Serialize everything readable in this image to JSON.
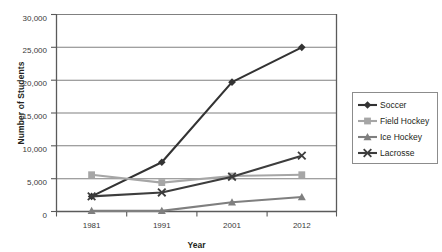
{
  "chart_data": {
    "type": "line",
    "title": "",
    "xlabel": "Year",
    "ylabel": "Number of Students",
    "categories": [
      "1981",
      "1991",
      "2001",
      "2012"
    ],
    "x_tick_labels": [
      "1981",
      "1991",
      "2001",
      "2012"
    ],
    "y_tick_labels": [
      "0",
      "5,000",
      "10,000",
      "15,000",
      "20,000",
      "25,000",
      "30,000"
    ],
    "y_tick_values": [
      0,
      5000,
      10000,
      15000,
      20000,
      25000,
      30000
    ],
    "ylim": [
      0,
      30000
    ],
    "grid": "horizontal",
    "legend_position": "right",
    "series": [
      {
        "name": "Soccer",
        "marker": "diamond",
        "color": "#333333",
        "values": [
          2300,
          7500,
          19700,
          25000
        ]
      },
      {
        "name": "Field Hockey",
        "marker": "square",
        "color": "#a6a6a6",
        "values": [
          5600,
          4400,
          5400,
          5600
        ]
      },
      {
        "name": "Ice Hockey",
        "marker": "triangle",
        "color": "#7f7f7f",
        "values": [
          100,
          100,
          1400,
          2200
        ]
      },
      {
        "name": "Lacrosse",
        "marker": "cross",
        "color": "#3d3d3d",
        "values": [
          2300,
          2900,
          5300,
          8500
        ]
      }
    ]
  },
  "legend": {
    "entries": [
      {
        "label": "Soccer"
      },
      {
        "label": "Field Hockey"
      },
      {
        "label": "Ice Hockey"
      },
      {
        "label": "Lacrosse"
      }
    ]
  },
  "axes": {
    "y_title": "Number of Students",
    "x_title": "Year"
  }
}
